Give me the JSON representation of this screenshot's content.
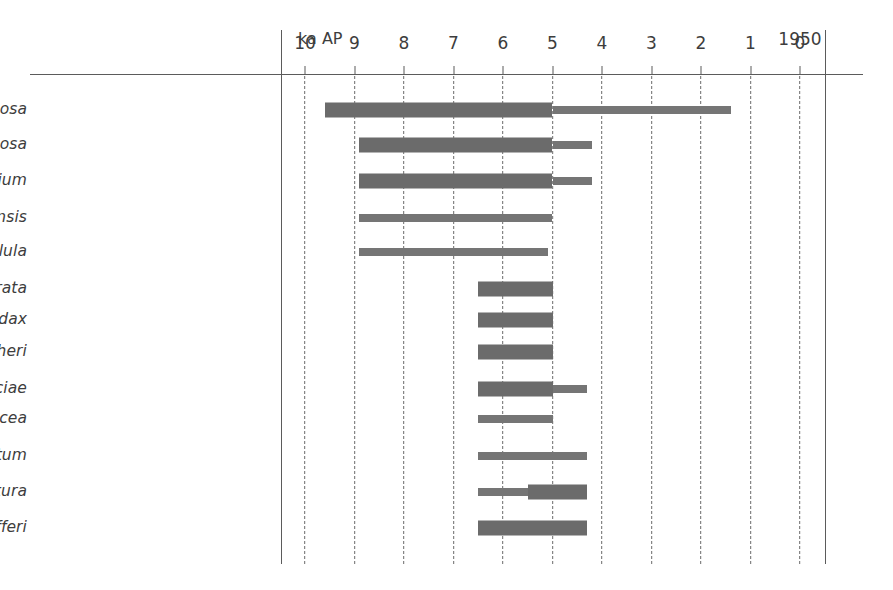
{
  "chart_data": {
    "type": "bar",
    "title": "",
    "subtitle": "",
    "xlabel": "ka AP",
    "ylabel": "",
    "xlim": [
      10.5,
      -0.5
    ],
    "x_axis_direction": "reversed",
    "grid": "vertical-dashed",
    "legend": "none",
    "axis_unit_caption": "ka AP",
    "year_caption": "1950",
    "year_caption_at": 0,
    "tick_values": [
      10,
      9,
      8,
      7,
      6,
      5,
      4,
      3,
      2,
      1,
      0
    ],
    "tick_labels": [
      "10",
      "9",
      "8",
      "7",
      "6",
      "5",
      "4",
      "3",
      "2",
      "1",
      "0"
    ],
    "categories": [
      "Tagiliarca granosa",
      "Anomalocardia squamosa",
      "Clypeomorus coralium",
      "Pictoneritina oulaniensis",
      "Pliacularia bellula",
      "Barbatia bicolorata",
      "Saccostrea mordax",
      "Periglypla fisheri",
      "Dendostrea paulucciae",
      "Standella capitlacea",
      "Gafrarium divaricatum",
      "Tellinimactora edentura",
      "Proclava pfefferi"
    ],
    "series": [
      {
        "name": "Occurrence range (ka AP)",
        "values": [
          {
            "label": "Tagiliarca granosa",
            "start": 9.6,
            "end": 1.4
          },
          {
            "label": "Anomalocardia squamosa",
            "start": 8.9,
            "end": 4.2
          },
          {
            "label": "Clypeomorus coralium",
            "start": 8.9,
            "end": 4.2
          },
          {
            "label": "Pictoneritina oulaniensis",
            "start": 8.9,
            "end": 5.0
          },
          {
            "label": "Pliacularia bellula",
            "start": 8.9,
            "end": 5.1
          },
          {
            "label": "Barbatia bicolorata",
            "start": 6.5,
            "end": 5.0
          },
          {
            "label": "Saccostrea mordax",
            "start": 6.5,
            "end": 5.0
          },
          {
            "label": "Periglypla fisheri",
            "start": 6.5,
            "end": 5.0
          },
          {
            "label": "Dendostrea paulucciae",
            "start": 6.5,
            "end": 4.3
          },
          {
            "label": "Standella capitlacea",
            "start": 6.5,
            "end": 5.0
          },
          {
            "label": "Gafrarium divaricatum",
            "start": 6.5,
            "end": 4.3
          },
          {
            "label": "Tellinimactora edentura",
            "start": 6.5,
            "end": 4.3
          },
          {
            "label": "Proclava pfefferi",
            "start": 6.5,
            "end": 4.3
          }
        ]
      }
    ],
    "segments": [
      {
        "row": 0,
        "label": "Tagiliarca granosa",
        "from": 9.6,
        "to": 5.0,
        "weight": "thick"
      },
      {
        "row": 0,
        "label": "Tagiliarca granosa",
        "from": 5.0,
        "to": 1.4,
        "weight": "thin"
      },
      {
        "row": 1,
        "label": "Anomalocardia squamosa",
        "from": 8.9,
        "to": 5.0,
        "weight": "thick"
      },
      {
        "row": 1,
        "label": "Anomalocardia squamosa",
        "from": 5.0,
        "to": 4.2,
        "weight": "thin"
      },
      {
        "row": 2,
        "label": "Clypeomorus coralium",
        "from": 8.9,
        "to": 5.0,
        "weight": "thick"
      },
      {
        "row": 2,
        "label": "Clypeomorus coralium",
        "from": 5.0,
        "to": 4.2,
        "weight": "thin"
      },
      {
        "row": 3,
        "label": "Pictoneritina oulaniensis",
        "from": 8.9,
        "to": 5.0,
        "weight": "thin"
      },
      {
        "row": 4,
        "label": "Pliacularia bellula",
        "from": 8.9,
        "to": 5.1,
        "weight": "thin"
      },
      {
        "row": 5,
        "label": "Barbatia bicolorata",
        "from": 6.5,
        "to": 5.0,
        "weight": "thick"
      },
      {
        "row": 6,
        "label": "Saccostrea mordax",
        "from": 6.5,
        "to": 5.0,
        "weight": "thick"
      },
      {
        "row": 7,
        "label": "Periglypla fisheri",
        "from": 6.5,
        "to": 5.0,
        "weight": "thick"
      },
      {
        "row": 8,
        "label": "Dendostrea paulucciae",
        "from": 6.5,
        "to": 5.0,
        "weight": "thick"
      },
      {
        "row": 8,
        "label": "Dendostrea paulucciae",
        "from": 5.0,
        "to": 4.3,
        "weight": "thin"
      },
      {
        "row": 9,
        "label": "Standella capitlacea",
        "from": 6.5,
        "to": 5.0,
        "weight": "thin"
      },
      {
        "row": 10,
        "label": "Gafrarium divaricatum",
        "from": 6.5,
        "to": 4.3,
        "weight": "thin"
      },
      {
        "row": 11,
        "label": "Tellinimactora edentura",
        "from": 6.5,
        "to": 5.5,
        "weight": "thin"
      },
      {
        "row": 11,
        "label": "Tellinimactora edentura",
        "from": 5.5,
        "to": 4.3,
        "weight": "thick"
      },
      {
        "row": 12,
        "label": "Proclava pfefferi",
        "from": 6.5,
        "to": 4.3,
        "weight": "thick"
      }
    ],
    "colors": {
      "bar": "#6b6b6b",
      "grid": "#6a6a6a",
      "axis": "#5b5b5b",
      "text": "#3d3d3d",
      "background": "#ffffff"
    },
    "row_y_px": [
      110,
      145,
      181,
      218,
      252,
      289,
      320,
      352,
      389,
      419,
      456,
      492,
      528
    ],
    "geometry": {
      "x_at_10ka": 305,
      "x_at_0ka": 800,
      "px_per_ka": 49.5,
      "thick_bar_height": 15,
      "thin_bar_height": 8
    }
  }
}
